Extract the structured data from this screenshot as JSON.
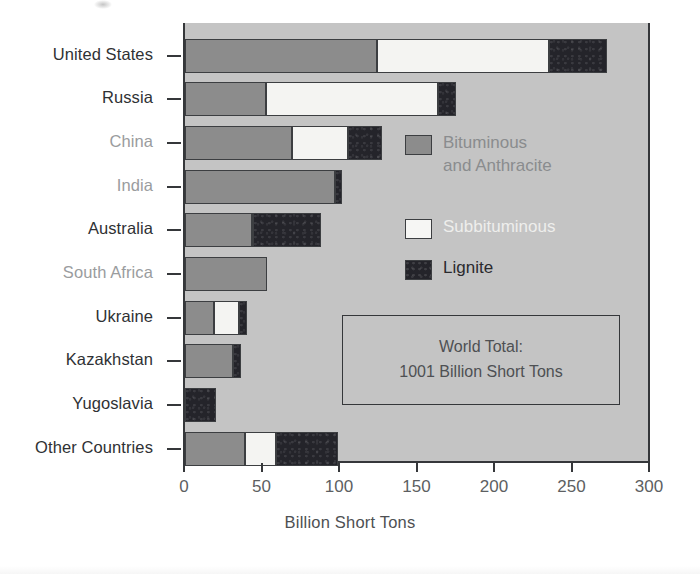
{
  "chart_data": {
    "type": "bar",
    "orientation": "horizontal",
    "stacked": true,
    "title": "",
    "xlabel": "Billion Short Tons",
    "ylabel": "",
    "xlim": [
      0,
      300
    ],
    "xticks": [
      0,
      50,
      100,
      150,
      200,
      250,
      300
    ],
    "xtick_labels": [
      "0",
      "50",
      "100",
      "150",
      "200",
      "250",
      "300"
    ],
    "grid": false,
    "legend_position": "inside-upper-right",
    "categories": [
      "United States",
      "Russia",
      "China",
      "India",
      "Australia",
      "South Africa",
      "Ukraine",
      "Kazakhstan",
      "Yugoslavia",
      "Other Countries"
    ],
    "series": [
      {
        "name": "Bituminous and Anthracite",
        "color": "#8c8c8c",
        "values": [
          124,
          52,
          69,
          97,
          43,
          53,
          19,
          31,
          0,
          39
        ]
      },
      {
        "name": "Subbituminous",
        "color": "#f4f4f2",
        "values": [
          111,
          111,
          36,
          0,
          1,
          0,
          16,
          0,
          0,
          20
        ]
      },
      {
        "name": "Lignite",
        "color": "#24242a",
        "values": [
          37,
          12,
          22,
          4,
          44,
          0,
          5,
          5,
          20,
          40
        ]
      }
    ],
    "totals": [
      272,
      175,
      127,
      101,
      88,
      53,
      40,
      36,
      20,
      99
    ],
    "annotation": {
      "line1": "World Total:",
      "line2": "1001 Billion Short Tons"
    }
  },
  "axis": {
    "x_title": "Billion Short Tons",
    "tick_labels": [
      "0",
      "50",
      "100",
      "150",
      "200",
      "250",
      "300"
    ]
  },
  "categories": [
    {
      "label": "United States",
      "tone": "dark"
    },
    {
      "label": "Russia",
      "tone": "dark"
    },
    {
      "label": "China",
      "tone": "light"
    },
    {
      "label": "India",
      "tone": "light"
    },
    {
      "label": "Australia",
      "tone": "dark"
    },
    {
      "label": "South Africa",
      "tone": "light"
    },
    {
      "label": "Ukraine",
      "tone": "dark"
    },
    {
      "label": "Kazakhstan",
      "tone": "dark"
    },
    {
      "label": "Yugoslavia",
      "tone": "dark"
    },
    {
      "label": "Other Countries",
      "tone": "dark"
    }
  ],
  "legend": {
    "items": [
      {
        "key": "bituminous",
        "line1": "Bituminous",
        "line2": "and Anthracite",
        "text_color": "#8a8c8e"
      },
      {
        "key": "subbituminous",
        "line1": "Subbituminous",
        "line2": "",
        "text_color": "#eeeeec"
      },
      {
        "key": "lignite",
        "line1": "Lignite",
        "line2": "",
        "text_color": "#2a2a2e"
      }
    ]
  },
  "total_box": {
    "line1": "World Total:",
    "line2": "1001 Billion Short Tons"
  },
  "colors": {
    "plot_background": "#c4c4c4",
    "page_background": "#ffffff",
    "axis": "#35373a",
    "bituminous": "#8c8c8c",
    "subbituminous": "#f4f4f2",
    "lignite": "#24242a",
    "label_dark": "#2f3134",
    "label_light": "#9a9c9e",
    "tick_label": "#5d5f62"
  }
}
